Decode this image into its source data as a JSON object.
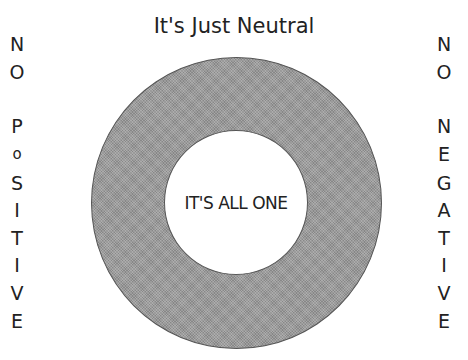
{
  "title": "It's Just Neutral",
  "center_label": "IT'S ALL ONE",
  "left_label": [
    "N",
    "O",
    "P",
    "o",
    "S",
    "I",
    "T",
    "I",
    "V",
    "E"
  ],
  "right_label": [
    "N",
    "O",
    "N",
    "E",
    "G",
    "A",
    "T",
    "I",
    "V",
    "E"
  ],
  "colors": {
    "ring": "#9a9a9a",
    "background": "#ffffff",
    "text": "#222222"
  }
}
